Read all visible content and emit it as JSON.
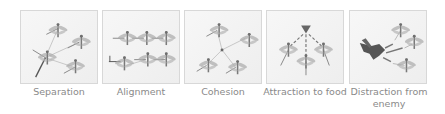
{
  "figure": {
    "panels": [
      {
        "id": "separation",
        "label": "Separation"
      },
      {
        "id": "alignment",
        "label": "Alignment"
      },
      {
        "id": "cohesion",
        "label": "Cohesion"
      },
      {
        "id": "attraction",
        "label": "Attraction to food"
      },
      {
        "id": "distraction",
        "label": "Distraction from enemy"
      }
    ]
  },
  "colors": {
    "panel_border": "#d8d8d8",
    "panel_bg": "#f2f2f2",
    "label_text": "#8a8a8a",
    "dragonfly": "#8c8c8c",
    "enemy": "#555555"
  }
}
